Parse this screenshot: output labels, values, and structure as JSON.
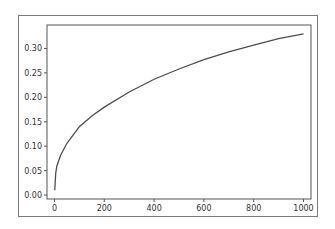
{
  "chart_data": {
    "type": "line",
    "title": "",
    "xlabel": "",
    "ylabel": "",
    "xlim": [
      -30,
      1030
    ],
    "ylim": [
      -0.008,
      0.348
    ],
    "xticks": [
      0,
      200,
      400,
      600,
      800,
      1000
    ],
    "xtick_labels": [
      "0",
      "200",
      "400",
      "600",
      "800",
      "1000"
    ],
    "yticks": [
      0.0,
      0.05,
      0.1,
      0.15,
      0.2,
      0.25,
      0.3
    ],
    "ytick_labels": [
      "0.00",
      "0.05",
      "0.10",
      "0.15",
      "0.20",
      "0.25",
      "0.30"
    ],
    "grid": false,
    "legend": null,
    "series": [
      {
        "name": "series-1",
        "color": "#4d4d4d",
        "x": [
          1,
          5,
          10,
          25,
          50,
          100,
          150,
          200,
          300,
          400,
          500,
          600,
          700,
          800,
          900,
          1000
        ],
        "y": [
          0.01,
          0.045,
          0.06,
          0.082,
          0.106,
          0.14,
          0.162,
          0.18,
          0.211,
          0.237,
          0.258,
          0.277,
          0.293,
          0.307,
          0.32,
          0.33
        ]
      }
    ]
  },
  "colors": {
    "frame": "#7a7a7a",
    "axes": "#555555",
    "line": "#4d4d4d",
    "text": "#333333"
  }
}
